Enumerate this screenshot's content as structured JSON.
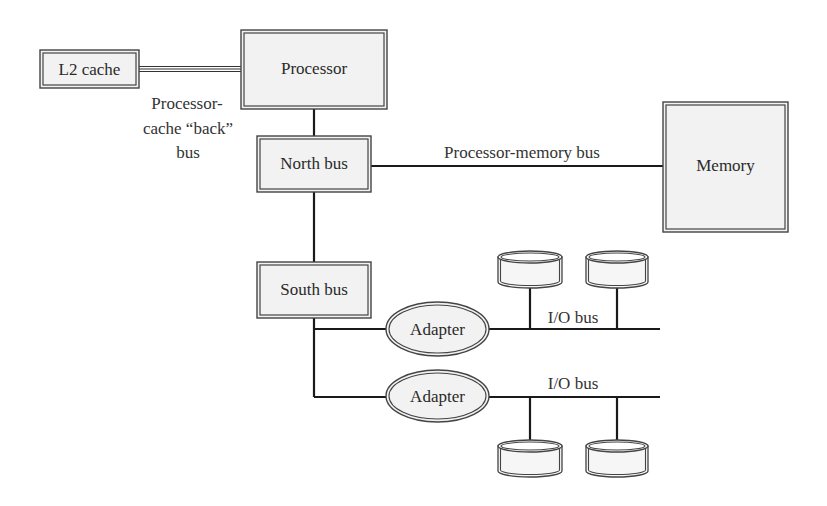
{
  "diagram": {
    "nodes": {
      "l2_cache": {
        "label": "L2 cache"
      },
      "processor": {
        "label": "Processor"
      },
      "north_bus": {
        "label": "North bus"
      },
      "memory": {
        "label": "Memory"
      },
      "south_bus": {
        "label": "South bus"
      },
      "adapter_1": {
        "label": "Adapter"
      },
      "adapter_2": {
        "label": "Adapter"
      }
    },
    "edges": {
      "back_bus": {
        "label_lines": [
          "Processor-",
          "cache “back”",
          "bus"
        ]
      },
      "processor_memory_bus": {
        "label": "Processor-memory bus"
      },
      "io_bus_1": {
        "label": "I/O bus"
      },
      "io_bus_2": {
        "label": "I/O bus"
      }
    },
    "disks": {
      "io_bus_1": [
        "disk",
        "disk"
      ],
      "io_bus_2": [
        "disk",
        "disk"
      ]
    },
    "colors": {
      "box_fill": "#f2f2f2",
      "stroke": "#444444",
      "line": "#1a1a1a",
      "text": "#2a2a2a"
    }
  }
}
